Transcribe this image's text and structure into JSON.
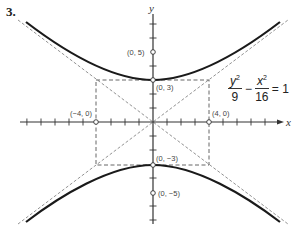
{
  "problem_number": "3.",
  "equation": {
    "term1_num": "y",
    "term1_den": "9",
    "term2_num": "x",
    "term2_den": "16",
    "exponent": "2",
    "minus": "−",
    "equals": "= 1"
  },
  "axes": {
    "x_label": "x",
    "y_label": "y"
  },
  "points": {
    "vertex_top": "(0, 3)",
    "vertex_bottom": "(0, −3)",
    "focus_top": "(0, 5)",
    "focus_bottom": "(0, −5)",
    "left": "(−4, 0)",
    "right": "(4, 0)"
  },
  "colors": {
    "curve": "#1a1a1a",
    "axis": "#333333",
    "dashed": "#666666"
  }
}
